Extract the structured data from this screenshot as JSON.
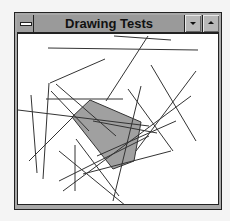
{
  "window": {
    "title": "Drawing Tests",
    "buttons": {
      "system_menu": "system-menu",
      "minimize": "minimize",
      "maximize": "maximize"
    }
  },
  "canvas": {
    "background": "#ffffff",
    "stroke_color": "#333333",
    "polygon_fill": "#a0a0a0",
    "polygon": [
      [
        89,
        99
      ],
      [
        140,
        121
      ],
      [
        133,
        160
      ],
      [
        112,
        168
      ],
      [
        71,
        116
      ]
    ],
    "lines": [
      [
        [
          113,
          35
        ],
        [
          170,
          39
        ]
      ],
      [
        [
          47,
          47
        ],
        [
          197,
          49
        ]
      ],
      [
        [
          147,
          35
        ],
        [
          105,
          100
        ]
      ],
      [
        [
          104,
          58
        ],
        [
          49,
          82
        ]
      ],
      [
        [
          45,
          98
        ],
        [
          122,
          98
        ]
      ],
      [
        [
          17,
          109
        ],
        [
          148,
          125
        ]
      ],
      [
        [
          30,
          94
        ],
        [
          36,
          172
        ]
      ],
      [
        [
          48,
          82
        ],
        [
          42,
          178
        ]
      ],
      [
        [
          50,
          90
        ],
        [
          88,
          130
        ]
      ],
      [
        [
          72,
          116
        ],
        [
          28,
          160
        ]
      ],
      [
        [
          150,
          64
        ],
        [
          195,
          140
        ]
      ],
      [
        [
          140,
          85
        ],
        [
          112,
          200
        ]
      ],
      [
        [
          195,
          70
        ],
        [
          135,
          150
        ]
      ],
      [
        [
          190,
          95
        ],
        [
          62,
          190
        ]
      ],
      [
        [
          55,
          83
        ],
        [
          115,
          135
        ]
      ],
      [
        [
          75,
          138
        ],
        [
          118,
          195
        ]
      ],
      [
        [
          92,
          120
        ],
        [
          156,
          132
        ]
      ],
      [
        [
          127,
          88
        ],
        [
          172,
          150
        ]
      ],
      [
        [
          175,
          120
        ],
        [
          96,
          155
        ]
      ],
      [
        [
          74,
          144
        ],
        [
          74,
          190
        ]
      ],
      [
        [
          82,
          173
        ],
        [
          170,
          150
        ]
      ],
      [
        [
          58,
          150
        ],
        [
          125,
          205
        ]
      ],
      [
        [
          58,
          180
        ],
        [
          148,
          135
        ]
      ]
    ]
  }
}
